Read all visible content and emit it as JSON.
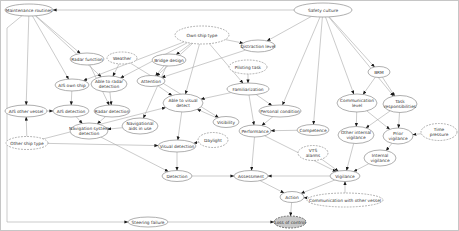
{
  "colors": {
    "background": "#ffffff",
    "frame": "#c6c6c6",
    "node_fill": "#ffffff",
    "node_stroke": "#8d8d8d",
    "shaded_fill": "#c9c9c9",
    "shaded_stroke": "#6b6b6b",
    "edge": "#a8a8a8",
    "arrow": "#1a1a1a",
    "text": "#333333"
  },
  "diagram": {
    "type": "bayesian-belief-network",
    "nodes": [
      {
        "id": "maintenance_routines",
        "label": "Maintenance routines",
        "lines": [
          "Maintenance routines"
        ],
        "x": 29,
        "y": 10,
        "rx": 24,
        "ry": 6,
        "style": "solid"
      },
      {
        "id": "safety_culture",
        "label": "Safety culture",
        "lines": [
          "Safety culture"
        ],
        "x": 323,
        "y": 10,
        "rx": 29,
        "ry": 7,
        "style": "solid"
      },
      {
        "id": "radar_function",
        "label": "Radar function",
        "lines": [
          "Radar function"
        ],
        "x": 87,
        "y": 59,
        "rx": 17,
        "ry": 6,
        "style": "solid"
      },
      {
        "id": "weather",
        "label": "Weather",
        "lines": [
          "Weather"
        ],
        "x": 122,
        "y": 58,
        "rx": 15,
        "ry": 6,
        "style": "dashed"
      },
      {
        "id": "own_ship_type",
        "label": "Own ship type",
        "lines": [
          "Own ship type"
        ],
        "x": 202,
        "y": 35,
        "rx": 27,
        "ry": 9,
        "style": "dashed"
      },
      {
        "id": "distraction_level",
        "label": "Distraction level",
        "lines": [
          "Distraction level"
        ],
        "x": 258,
        "y": 46,
        "rx": 17,
        "ry": 6,
        "style": "solid"
      },
      {
        "id": "bridge_design",
        "label": "Bridge design",
        "lines": [
          "Bridge design"
        ],
        "x": 169,
        "y": 60,
        "rx": 17,
        "ry": 6,
        "style": "solid"
      },
      {
        "id": "piloting_task",
        "label": "Piloting task",
        "lines": [
          "Piloting task"
        ],
        "x": 248,
        "y": 67,
        "rx": 19,
        "ry": 7,
        "style": "dashed"
      },
      {
        "id": "ais_own_ship",
        "label": "AIS own ship",
        "lines": [
          "AIS own ship"
        ],
        "x": 72,
        "y": 85,
        "rx": 17,
        "ry": 6,
        "style": "solid"
      },
      {
        "id": "able_radar_detection",
        "label": "Able to radar detection",
        "lines": [
          "Able to radar",
          "detection"
        ],
        "x": 109,
        "y": 84,
        "rx": 18,
        "ry": 8,
        "style": "solid"
      },
      {
        "id": "attention",
        "label": "Attention",
        "lines": [
          "Attention"
        ],
        "x": 151,
        "y": 81,
        "rx": 14,
        "ry": 5.5,
        "style": "solid"
      },
      {
        "id": "familiarization",
        "label": "Familiarization",
        "lines": [
          "Familiarization"
        ],
        "x": 248,
        "y": 89,
        "rx": 21,
        "ry": 6,
        "style": "solid"
      },
      {
        "id": "ais_other_vessel",
        "label": "AIS other vessel",
        "lines": [
          "AIS other vessel"
        ],
        "x": 26,
        "y": 111,
        "rx": 21,
        "ry": 6,
        "style": "solid"
      },
      {
        "id": "ais_detection",
        "label": "AIS detection",
        "lines": [
          "AIS detection"
        ],
        "x": 71,
        "y": 111,
        "rx": 18,
        "ry": 6,
        "style": "solid"
      },
      {
        "id": "radar_detection",
        "label": "Radar detection",
        "lines": [
          "Radar detection"
        ],
        "x": 112,
        "y": 111,
        "rx": 18,
        "ry": 6,
        "style": "solid"
      },
      {
        "id": "navigational_aids",
        "label": "Navigational aids in use",
        "lines": [
          "Navigational",
          "aids in use"
        ],
        "x": 140,
        "y": 126,
        "rx": 18,
        "ry": 8,
        "style": "solid"
      },
      {
        "id": "nav_system_detection",
        "label": "Navigation system detection",
        "lines": [
          "Navigation system",
          "detection"
        ],
        "x": 89,
        "y": 131,
        "rx": 19,
        "ry": 8,
        "style": "solid"
      },
      {
        "id": "other_ship_type",
        "label": "Other ship type",
        "lines": [
          "Other ship type"
        ],
        "x": 27,
        "y": 143,
        "rx": 21,
        "ry": 6.5,
        "style": "dashed"
      },
      {
        "id": "able_visual_detect",
        "label": "Able to visual detect",
        "lines": [
          "Able to visual",
          "detect"
        ],
        "x": 183,
        "y": 103,
        "rx": 20,
        "ry": 9,
        "style": "solid"
      },
      {
        "id": "visibility",
        "label": "Visibility",
        "lines": [
          "Visibility"
        ],
        "x": 226,
        "y": 122,
        "rx": 13,
        "ry": 5.5,
        "style": "solid"
      },
      {
        "id": "daylight",
        "label": "Daylight",
        "lines": [
          "Daylight"
        ],
        "x": 213,
        "y": 140,
        "rx": 15,
        "ry": 7.5,
        "style": "dashed"
      },
      {
        "id": "visual_detection",
        "label": "Visual detection",
        "lines": [
          "Visual detection"
        ],
        "x": 177,
        "y": 146,
        "rx": 19,
        "ry": 6,
        "style": "solid"
      },
      {
        "id": "performance",
        "label": "Performance",
        "lines": [
          "Performance"
        ],
        "x": 255,
        "y": 131,
        "rx": 16,
        "ry": 6,
        "style": "solid"
      },
      {
        "id": "personal_condition",
        "label": "Personal condition",
        "lines": [
          "Personal condition"
        ],
        "x": 280,
        "y": 111,
        "rx": 21,
        "ry": 6,
        "style": "solid"
      },
      {
        "id": "competence",
        "label": "Competence",
        "lines": [
          "Competence"
        ],
        "x": 313,
        "y": 130,
        "rx": 16,
        "ry": 5.5,
        "style": "solid"
      },
      {
        "id": "brm",
        "label": "BRM",
        "lines": [
          "BRM"
        ],
        "x": 379,
        "y": 72,
        "rx": 11,
        "ry": 5.5,
        "style": "solid"
      },
      {
        "id": "communication_level",
        "label": "Communication level",
        "lines": [
          "Communication",
          "level"
        ],
        "x": 357,
        "y": 103,
        "rx": 20,
        "ry": 9,
        "style": "solid"
      },
      {
        "id": "task_responsibilities",
        "label": "Task responsibilities",
        "lines": [
          "Task",
          "responsibilities"
        ],
        "x": 400,
        "y": 104,
        "rx": 17,
        "ry": 8.5,
        "style": "solid"
      },
      {
        "id": "other_internal_vigilance",
        "label": "Other internal vigilance",
        "lines": [
          "Other internal",
          "vigilance"
        ],
        "x": 356,
        "y": 135,
        "rx": 18,
        "ry": 8.5,
        "style": "solid"
      },
      {
        "id": "prior_vigilance",
        "label": "Prior vigilance",
        "lines": [
          "Prior",
          "vigilance"
        ],
        "x": 398,
        "y": 136,
        "rx": 15,
        "ry": 8,
        "style": "solid"
      },
      {
        "id": "time_pressure",
        "label": "Time pressure",
        "lines": [
          "Time",
          "pressure"
        ],
        "x": 439,
        "y": 132,
        "rx": 18,
        "ry": 8.5,
        "style": "dashed"
      },
      {
        "id": "vts_alarms",
        "label": "VTS alarms",
        "lines": [
          "VTS",
          "alarms"
        ],
        "x": 313,
        "y": 153,
        "rx": 15,
        "ry": 7.5,
        "style": "dashed"
      },
      {
        "id": "internal_vigilance",
        "label": "Internal vigilance",
        "lines": [
          "Internal",
          "vigilance"
        ],
        "x": 380,
        "y": 158,
        "rx": 16,
        "ry": 8,
        "style": "solid"
      },
      {
        "id": "vigilance",
        "label": "Vigilance",
        "lines": [
          "Vigilance"
        ],
        "x": 345,
        "y": 176,
        "rx": 15,
        "ry": 5.5,
        "style": "solid"
      },
      {
        "id": "comm_other_vessel",
        "label": "Communication with other vessel",
        "lines": [
          "Communication with other vessel"
        ],
        "x": 345,
        "y": 200,
        "rx": 38,
        "ry": 7,
        "style": "dashed"
      },
      {
        "id": "detection",
        "label": "Detection",
        "lines": [
          "Detection"
        ],
        "x": 177,
        "y": 176,
        "rx": 15,
        "ry": 5.5,
        "style": "solid"
      },
      {
        "id": "assessment",
        "label": "Assessment",
        "lines": [
          "Assessment"
        ],
        "x": 251,
        "y": 176,
        "rx": 17,
        "ry": 5.5,
        "style": "solid"
      },
      {
        "id": "action",
        "label": "Action",
        "lines": [
          "Action"
        ],
        "x": 292,
        "y": 197,
        "rx": 12,
        "ry": 5.5,
        "style": "solid"
      },
      {
        "id": "steering_failure",
        "label": "Steering failure",
        "lines": [
          "Steering failure"
        ],
        "x": 148,
        "y": 222,
        "rx": 20,
        "ry": 5,
        "style": "solid"
      },
      {
        "id": "loss_of_control",
        "label": "Loss of control",
        "lines": [
          "Loss of control"
        ],
        "x": 290,
        "y": 222,
        "rx": 16,
        "ry": 6,
        "style": "shaded"
      }
    ],
    "edges": [
      {
        "from": "safety_culture",
        "to": "maintenance_routines"
      },
      {
        "from": "maintenance_routines",
        "to": "radar_function"
      },
      {
        "from": "maintenance_routines",
        "to": "ais_own_ship"
      },
      {
        "from": "maintenance_routines",
        "to": "ais_other_vessel"
      },
      {
        "from": "maintenance_routines",
        "to": "able_radar_detection"
      },
      {
        "from": "maintenance_routines",
        "to": "steering_failure",
        "via": [
          [
            7,
            28
          ],
          [
            7,
            222
          ]
        ]
      },
      {
        "from": "own_ship_type",
        "to": "bridge_design"
      },
      {
        "from": "own_ship_type",
        "to": "distraction_level"
      },
      {
        "from": "own_ship_type",
        "to": "ais_own_ship"
      },
      {
        "from": "own_ship_type",
        "to": "able_radar_detection"
      },
      {
        "from": "own_ship_type",
        "to": "attention"
      },
      {
        "from": "own_ship_type",
        "to": "familiarization"
      },
      {
        "from": "own_ship_type",
        "to": "able_visual_detect"
      },
      {
        "from": "safety_culture",
        "to": "distraction_level"
      },
      {
        "from": "safety_culture",
        "to": "brm"
      },
      {
        "from": "safety_culture",
        "to": "communication_level"
      },
      {
        "from": "safety_culture",
        "to": "task_responsibilities"
      },
      {
        "from": "safety_culture",
        "to": "competence"
      },
      {
        "from": "safety_culture",
        "to": "personal_condition"
      },
      {
        "from": "bridge_design",
        "to": "attention"
      },
      {
        "from": "bridge_design",
        "to": "navigational_aids"
      },
      {
        "from": "distraction_level",
        "to": "attention"
      },
      {
        "from": "piloting_task",
        "to": "familiarization"
      },
      {
        "from": "radar_function",
        "to": "radar_detection"
      },
      {
        "from": "weather",
        "to": "able_radar_detection"
      },
      {
        "from": "weather",
        "to": "visibility"
      },
      {
        "from": "ais_own_ship",
        "to": "ais_detection"
      },
      {
        "from": "able_radar_detection",
        "to": "radar_detection"
      },
      {
        "from": "ais_other_vessel",
        "to": "ais_detection"
      },
      {
        "from": "other_ship_type",
        "to": "ais_other_vessel"
      },
      {
        "from": "other_ship_type",
        "to": "able_visual_detect"
      },
      {
        "from": "other_ship_type",
        "to": "visual_detection"
      },
      {
        "from": "ais_detection",
        "to": "nav_system_detection"
      },
      {
        "from": "radar_detection",
        "to": "nav_system_detection"
      },
      {
        "from": "navigational_aids",
        "to": "nav_system_detection"
      },
      {
        "from": "nav_system_detection",
        "to": "detection"
      },
      {
        "from": "visual_detection",
        "to": "detection"
      },
      {
        "from": "able_visual_detect",
        "to": "visual_detection"
      },
      {
        "from": "visibility",
        "to": "able_visual_detect"
      },
      {
        "from": "daylight",
        "to": "visual_detection"
      },
      {
        "from": "attention",
        "to": "able_visual_detect"
      },
      {
        "from": "familiarization",
        "to": "performance"
      },
      {
        "from": "familiarization",
        "to": "personal_condition"
      },
      {
        "from": "familiarization",
        "to": "able_visual_detect"
      },
      {
        "from": "personal_condition",
        "to": "performance"
      },
      {
        "from": "competence",
        "to": "performance"
      },
      {
        "from": "brm",
        "to": "communication_level"
      },
      {
        "from": "brm",
        "to": "task_responsibilities"
      },
      {
        "from": "communication_level",
        "to": "other_internal_vigilance"
      },
      {
        "from": "communication_level",
        "to": "prior_vigilance"
      },
      {
        "from": "task_responsibilities",
        "to": "other_internal_vigilance"
      },
      {
        "from": "task_responsibilities",
        "to": "prior_vigilance"
      },
      {
        "from": "time_pressure",
        "to": "prior_vigilance"
      },
      {
        "from": "other_internal_vigilance",
        "to": "vigilance"
      },
      {
        "from": "prior_vigilance",
        "to": "internal_vigilance"
      },
      {
        "from": "internal_vigilance",
        "to": "vigilance"
      },
      {
        "from": "vts_alarms",
        "to": "vigilance"
      },
      {
        "from": "performance",
        "to": "vigilance"
      },
      {
        "from": "comm_other_vessel",
        "to": "vigilance"
      },
      {
        "from": "comm_other_vessel",
        "to": "action"
      },
      {
        "from": "performance",
        "to": "assessment"
      },
      {
        "from": "vigilance",
        "to": "assessment"
      },
      {
        "from": "detection",
        "to": "assessment"
      },
      {
        "from": "assessment",
        "to": "action"
      },
      {
        "from": "vigilance",
        "to": "action"
      },
      {
        "from": "action",
        "to": "loss_of_control"
      },
      {
        "from": "steering_failure",
        "to": "loss_of_control"
      }
    ]
  }
}
